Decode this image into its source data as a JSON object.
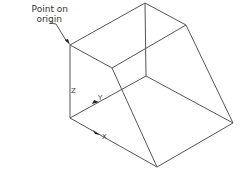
{
  "annotation": {
    "line1": "Point on",
    "line2": "origin"
  },
  "axes": {
    "z": "Z",
    "y": "Y",
    "x": "X"
  },
  "colors": {
    "edge": "#555555",
    "arrow": "#222222"
  }
}
